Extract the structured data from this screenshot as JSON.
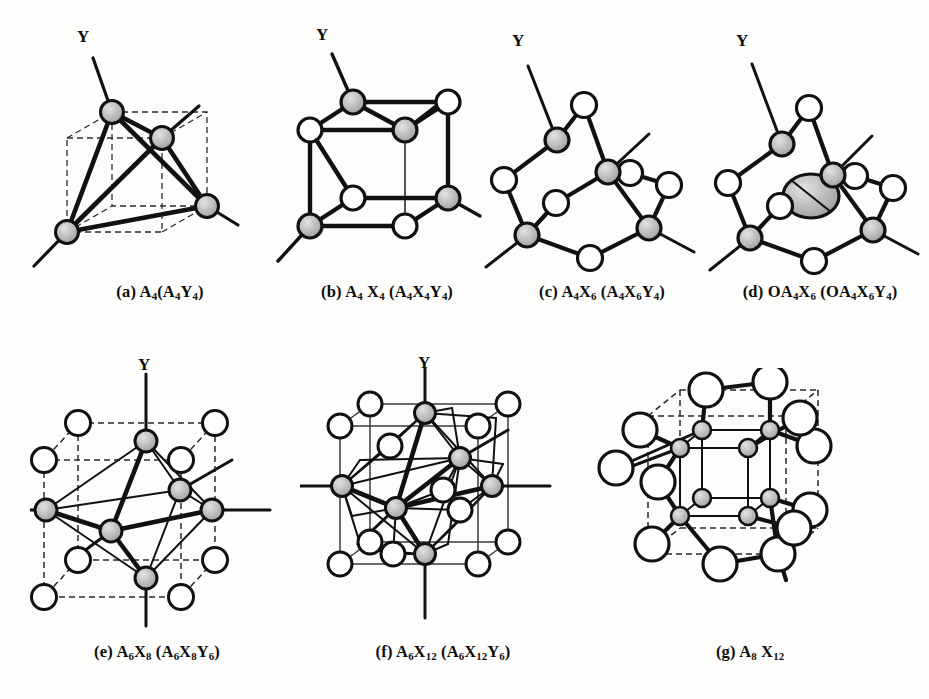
{
  "figure": {
    "title": "",
    "background_color": "#fdfdfb",
    "ink_color": "#111111",
    "atom_fill_shaded": "#b0b0b0",
    "atom_fill_open": "#ffffff",
    "panel_count": 7
  },
  "legend": {
    "shaded_circle_meaning": "A atom (metal)",
    "open_circle_meaning": "X atom (bridging ligand)",
    "large_shaded_circle_meaning": "O interstitial atom",
    "free_line_meaning": "Y terminal ligand bond"
  },
  "panels": [
    {
      "id": "a",
      "tag": "(a)",
      "formula_plain": "A4(A4Y4)",
      "caption_html": "(a) A<sub>4</sub>(A<sub>4</sub>Y<sub>4</sub>)",
      "axis_label": "Y",
      "cluster_core": "tetrahedron",
      "a_atom_count": 4,
      "x_atom_count": 0,
      "y_bond_count": 4,
      "reference_cube": "dashed",
      "caption_x": 55,
      "caption_y": 284,
      "caption_width": 210
    },
    {
      "id": "b",
      "tag": "(b)",
      "formula_plain": "A4 X4 (A4X4Y4)",
      "caption_html": "(b) A<sub>4</sub> X<sub>4</sub> (A<sub>4</sub>X<sub>4</sub>Y<sub>4</sub>)",
      "axis_label": "Y",
      "cluster_core": "cubane",
      "a_atom_count": 4,
      "x_atom_count": 4,
      "y_bond_count": 4,
      "reference_cube": "solid",
      "caption_x": 272,
      "caption_y": 284,
      "caption_width": 230
    },
    {
      "id": "c",
      "tag": "(c)",
      "formula_plain": "A4X6(A4X6Y4)",
      "caption_html": "(c) A<sub>4</sub>X<sub>6</sub> (A<sub>4</sub>X<sub>6</sub>Y<sub>4</sub>)",
      "axis_label": "Y",
      "cluster_core": "adamantane",
      "a_atom_count": 4,
      "x_atom_count": 6,
      "y_bond_count": 4,
      "reference_cube": "none",
      "caption_x": 492,
      "caption_y": 284,
      "caption_width": 220
    },
    {
      "id": "d",
      "tag": "(d)",
      "formula_plain": "OA4X6 (OA4X6Y4)",
      "caption_html": "(d) OA<sub>4</sub>X<sub>6</sub> (OA<sub>4</sub>X<sub>6</sub>Y<sub>4</sub>)",
      "axis_label": "Y",
      "cluster_core": "centered-adamantane",
      "a_atom_count": 4,
      "x_atom_count": 6,
      "interstitial_atom": "O",
      "y_bond_count": 4,
      "reference_cube": "none",
      "caption_x": 705,
      "caption_y": 284,
      "caption_width": 230
    },
    {
      "id": "e",
      "tag": "(e)",
      "formula_plain": "A6X8(A6X8Y6)",
      "caption_html": "(e) A<sub>6</sub>X<sub>8</sub> (A<sub>6</sub>X<sub>8</sub>Y<sub>6</sub>)",
      "axis_label": "Y",
      "cluster_core": "octahedron-in-cube",
      "a_atom_count": 6,
      "x_atom_count": 8,
      "y_bond_count": 6,
      "reference_cube": "dashed",
      "caption_x": 42,
      "caption_y": 644,
      "caption_width": 230
    },
    {
      "id": "f",
      "tag": "(f)",
      "formula_plain": "A6X12 (A6X12Y6)",
      "caption_html": "(f) A<sub>6</sub>X<sub>12</sub> (A<sub>6</sub>X<sub>12</sub>Y<sub>6</sub>)",
      "axis_label": "Y",
      "cluster_core": "octahedron-edge-bridged",
      "a_atom_count": 6,
      "x_atom_count": 12,
      "y_bond_count": 6,
      "reference_cube": "solid",
      "caption_x": 318,
      "caption_y": 644,
      "caption_width": 250
    },
    {
      "id": "g",
      "tag": "(g)",
      "formula_plain": "A8 X12",
      "caption_html": "(g) A<sub>8</sub> X<sub>12</sub>",
      "axis_label": "",
      "cluster_core": "cube-edge-bridged",
      "a_atom_count": 8,
      "x_atom_count": 12,
      "y_bond_count": 0,
      "reference_cube": "dashed",
      "caption_x": 650,
      "caption_y": 644,
      "caption_width": 200
    }
  ]
}
